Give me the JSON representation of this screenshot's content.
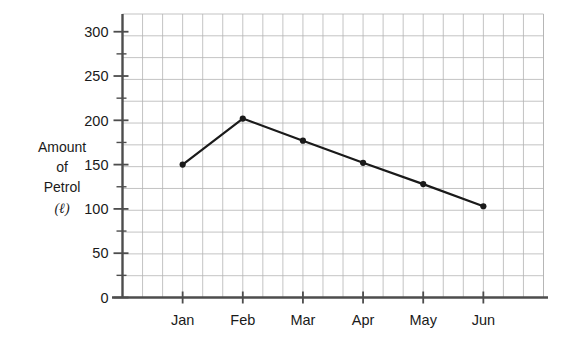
{
  "chart_data": {
    "type": "line",
    "title": "",
    "subtitle": "",
    "xlabel": "",
    "ylabel": "Amount of Petrol (ℓ)",
    "ylabel_lines": [
      "Amount",
      "of",
      "Petrol",
      "(ℓ)"
    ],
    "categories": [
      "Jan",
      "Feb",
      "Mar",
      "Apr",
      "May",
      "Jun"
    ],
    "values": [
      150,
      202,
      177,
      152,
      128,
      103
    ],
    "series": [
      {
        "name": "Amount of Petrol",
        "values": [
          150,
          202,
          177,
          152,
          128,
          103
        ]
      }
    ],
    "ylim": [
      0,
      320
    ],
    "ytick_labels": [
      "0",
      "50",
      "100",
      "150",
      "200",
      "250",
      "300"
    ],
    "ytick_values": [
      0,
      50,
      100,
      150,
      200,
      250,
      300
    ],
    "yminor_step": 25,
    "grid": "on",
    "grid_color": "#b4b4b4",
    "legend": "none",
    "line_color": "#1a1a1a",
    "marker": "circle",
    "marker_color": "#1a1a1a",
    "axis_color": "#4d4d4d",
    "background": "#ffffff"
  },
  "axis": {
    "y_unit_symbol": "ℓ",
    "y_unit_open_paren": "(",
    "y_unit_close_paren": ")"
  }
}
